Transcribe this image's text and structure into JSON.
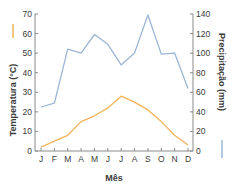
{
  "chart_data": {
    "type": "line",
    "title": "",
    "xlabel": "Mês",
    "ylabel": "Temperatura (°C)",
    "y2label": "Precipitação (mm)",
    "categories": [
      "J",
      "F",
      "M",
      "A",
      "M",
      "J",
      "J",
      "A",
      "S",
      "O",
      "N",
      "D"
    ],
    "series": [
      {
        "name": "Temperatura (°C)",
        "axis": "left",
        "color": "#f2b35a",
        "values": [
          2,
          5,
          8,
          15,
          18,
          22,
          28,
          25,
          21,
          15,
          8,
          3
        ]
      },
      {
        "name": "Precipitação (mm)",
        "axis": "right",
        "color": "#9bb6d6",
        "values": [
          45,
          49,
          104,
          100,
          119,
          109,
          88,
          100,
          139,
          99,
          100,
          64
        ]
      }
    ],
    "ylim": [
      0,
      70
    ],
    "y2lim": [
      0,
      140
    ],
    "yticks": [
      0,
      10,
      20,
      30,
      40,
      50,
      60,
      70
    ],
    "y2ticks": [
      0,
      20,
      40,
      60,
      80,
      100,
      120,
      140
    ],
    "grid": false,
    "legend": "axis-title color swatches"
  }
}
